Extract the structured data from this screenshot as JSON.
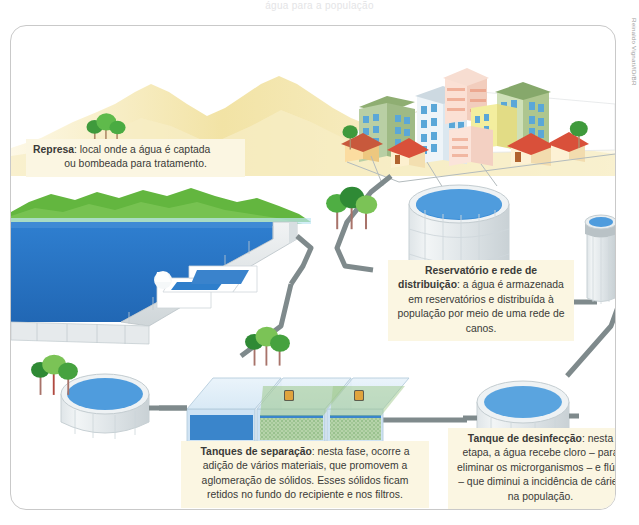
{
  "figure": {
    "top_sliver_text": "água para a população",
    "credit": "Reinaldo Vignati/ID/BR",
    "title_hidden": "Tratamento de água",
    "frame_color": "#c9c9c9",
    "background": "#ffffff"
  },
  "palette": {
    "caption_bg": "#fbf6e2",
    "caption_text": "#3a3a38",
    "water_blue": "#2a77c8",
    "water_blue_light": "#6aa8e0",
    "tank_grey": "#e8ecee",
    "tank_grey_dark": "#c4cdd2",
    "pipe_grey": "#7f8a8c",
    "mountain_sand": "#f2e3a8",
    "hill_green": "#6eb84a",
    "tree_green": "#4fa63d",
    "road_grey": "#9aa3a6"
  },
  "captions": {
    "represa": {
      "name": "Represa",
      "separator": ":",
      "line1": " local onde a água é captada",
      "line2": "ou bombeada para tratamento."
    },
    "reservatorio": {
      "name": "Reservatório e rede de distribuição",
      "separator": ":",
      "body": " a água é armazenada em reservatórios e distribuída à população por meio de uma rede de canos."
    },
    "tanques": {
      "name": "Tanques de separação",
      "separator": ":",
      "body": " nesta fase, ocorre a adição de vários materiais, que promovem a aglomeração de sólidos. Esses sólidos ficam retidos no fundo do recipiente e nos filtros."
    },
    "desinfeccao": {
      "name": "Tanque de desinfecção",
      "separator": ":",
      "body": " nesta etapa, a água recebe cloro – para eliminar os microrganismos – e flúor – que diminui a incidência de cáries na população."
    }
  },
  "scene": {
    "elements": [
      {
        "id": "mountains",
        "label": "Montanhas ao fundo"
      },
      {
        "id": "trees-back",
        "label": "Árvores ao fundo"
      },
      {
        "id": "hills",
        "label": "Colinas verdes"
      },
      {
        "id": "dam-lake",
        "label": "Represa (lago)"
      },
      {
        "id": "dam-wall",
        "label": "Parede da represa"
      },
      {
        "id": "dam-intake",
        "label": "Captação de água"
      },
      {
        "id": "city",
        "label": "Cidade com prédios e casas"
      },
      {
        "id": "city-roads",
        "label": "Ruas da cidade"
      },
      {
        "id": "reservoir-tank",
        "label": "Reservatório grande"
      },
      {
        "id": "standpipe-tank",
        "label": "Caixa d'água elevada"
      },
      {
        "id": "settling-tanks",
        "label": "Tanques de separação"
      },
      {
        "id": "round-tank-left",
        "label": "Tanque circular à esquerda"
      },
      {
        "id": "disinfection-tank",
        "label": "Tanque de desinfecção"
      },
      {
        "id": "pipes",
        "label": "Rede de canos"
      }
    ]
  }
}
